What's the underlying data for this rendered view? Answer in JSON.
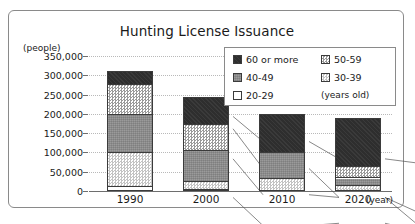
{
  "chart_data": {
    "type": "bar",
    "title": "Hunting License Issuance",
    "xlabel": "(year)",
    "ylabel": "(people)",
    "categories": [
      "1990",
      "2000",
      "2010",
      "2020"
    ],
    "ylim": [
      0,
      350000
    ],
    "ytick_labels": [
      "350,000",
      "300,000",
      "250,000",
      "200,000",
      "150,000",
      "100,000",
      "50,000",
      "0"
    ],
    "ytick_values": [
      350000,
      300000,
      250000,
      200000,
      150000,
      100000,
      50000,
      0
    ],
    "grid": true,
    "stacked": true,
    "legend_position": "upper-right",
    "legend_unit": "(years old)",
    "series": [
      {
        "name": "60 or more",
        "pattern": "solid-dark",
        "color": "#2e2e2e",
        "values": [
          32000,
          70000,
          100000,
          125000
        ]
      },
      {
        "name": "50-59",
        "pattern": "checker-medium",
        "color": "#9a9a9a",
        "values": [
          78000,
          68000,
          0,
          30000
        ]
      },
      {
        "name": "40-49",
        "pattern": "gray-texture",
        "color": "#8d8d8d",
        "values": [
          100000,
          80000,
          67000,
          20000
        ]
      },
      {
        "name": "30-39",
        "pattern": "checker-light",
        "color": "#c3c3c3",
        "values": [
          87000,
          22000,
          30000,
          12000
        ]
      },
      {
        "name": "20-29",
        "pattern": "white",
        "color": "#ffffff",
        "values": [
          13000,
          5000,
          3000,
          3000
        ]
      }
    ],
    "totals": [
      310000,
      245000,
      200000,
      190000
    ],
    "annotations": []
  },
  "chart": {
    "title": "Hunting License Issuance",
    "y_caption": "(people)",
    "x_caption": "(year)"
  },
  "legend": {
    "items": [
      {
        "label": "60 or more"
      },
      {
        "label": "50-59"
      },
      {
        "label": "40-49"
      },
      {
        "label": "30-39"
      },
      {
        "label": "20-29"
      }
    ],
    "unit": "(years old)"
  }
}
